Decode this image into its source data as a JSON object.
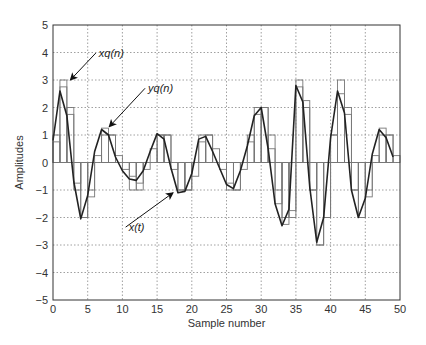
{
  "chart_data": {
    "type": "line",
    "title": "",
    "xlabel": "Sample number",
    "ylabel": "Amplitudes",
    "xlim": [
      0,
      50
    ],
    "ylim": [
      -5,
      5
    ],
    "xticks": [
      0,
      5,
      10,
      15,
      20,
      25,
      30,
      35,
      40,
      45,
      50
    ],
    "yticks": [
      -5,
      -4,
      -3,
      -2,
      -1,
      0,
      1,
      2,
      3,
      4,
      5
    ],
    "ytick_labels": [
      "−5",
      "−4",
      "−3",
      "−2",
      "−1",
      "0",
      "1",
      "2",
      "3",
      "4",
      "5"
    ],
    "grid": true,
    "x": [
      0,
      1,
      2,
      3,
      4,
      5,
      6,
      7,
      8,
      9,
      10,
      11,
      12,
      13,
      14,
      15,
      16,
      17,
      18,
      19,
      20,
      21,
      22,
      23,
      24,
      25,
      26,
      27,
      28,
      29,
      30,
      31,
      32,
      33,
      34,
      35,
      36,
      37,
      38,
      39,
      40,
      41,
      42,
      43,
      44,
      45,
      46,
      47,
      48,
      49
    ],
    "series": [
      {
        "name": "x(t)",
        "style": "line",
        "values": [
          0.8,
          2.6,
          1.7,
          -0.7,
          -2.05,
          -1.2,
          0.4,
          1.2,
          1.0,
          0.2,
          -0.3,
          -0.6,
          -0.65,
          -0.3,
          0.4,
          1.05,
          0.85,
          -0.2,
          -1.1,
          -1.05,
          -0.4,
          0.85,
          0.95,
          0.4,
          -0.2,
          -0.8,
          -0.95,
          -0.3,
          0.6,
          1.7,
          2.0,
          0.5,
          -1.5,
          -2.3,
          -1.7,
          2.8,
          2.2,
          -0.9,
          -2.9,
          -2.0,
          0.9,
          2.6,
          1.8,
          -1.0,
          -2.0,
          -1.3,
          0.3,
          1.2,
          0.9,
          0.2
        ]
      },
      {
        "name": "xq(n)",
        "style": "step",
        "values": [
          1,
          3,
          2,
          -1,
          -2,
          -1,
          0,
          1,
          1,
          0,
          0,
          -1,
          -1,
          0,
          0,
          1,
          1,
          0,
          -1,
          -1,
          0,
          1,
          1,
          0,
          0,
          -1,
          -1,
          0,
          1,
          2,
          2,
          1,
          -1,
          -2,
          -2,
          3,
          2,
          -1,
          -3,
          -2,
          1,
          3,
          2,
          -1,
          -2,
          -1,
          0,
          1,
          1,
          0
        ]
      },
      {
        "name": "yq(n)",
        "style": "step",
        "values": [
          0.75,
          2.75,
          1.75,
          -0.75,
          -2.0,
          -1.25,
          0.25,
          1.25,
          1.0,
          0.25,
          -0.25,
          -0.5,
          -0.75,
          -0.25,
          0.5,
          1.0,
          1.0,
          -0.25,
          -1.0,
          -1.0,
          -0.5,
          0.75,
          1.0,
          0.5,
          -0.25,
          -0.75,
          -1.0,
          -0.25,
          0.75,
          1.75,
          2.0,
          0.5,
          -1.5,
          -2.25,
          -1.75,
          2.75,
          2.25,
          -1.0,
          -3.0,
          -2.0,
          1.0,
          2.5,
          1.75,
          -1.0,
          -2.0,
          -1.25,
          0.25,
          1.25,
          1.0,
          0.25
        ]
      }
    ],
    "annotations": [
      {
        "text": "xq(n)",
        "label_x": 6.6,
        "label_y": 3.98,
        "arrow_to": [
          2.5,
          3.0
        ]
      },
      {
        "text": "yq(n)",
        "label_x": 13.7,
        "label_y": 2.7,
        "arrow_to": [
          8.1,
          1.3
        ]
      },
      {
        "text": "x(t)",
        "label_x": 10.9,
        "label_y": -2.35,
        "arrow_to": [
          17.3,
          -1.1
        ]
      }
    ]
  }
}
